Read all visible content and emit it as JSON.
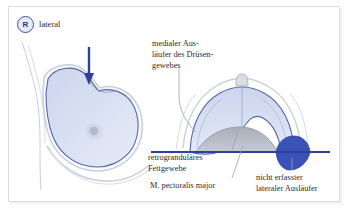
{
  "figure": {
    "type": "anatomical-diagram",
    "language": "de"
  },
  "badge": {
    "letter": "R",
    "circle_stroke": "#3f51a8",
    "circle_fill": "#e8ebf6"
  },
  "labels": {
    "lateral": "lateral",
    "medial_auslaeufer": "medialer Aus-\nläufer des Drüsen-\ngewebes",
    "retroglandulaeres_fettgewebe": "retrogranduläres\nFettgewebe",
    "pectoralis": "M. pectoralis major",
    "nicht_erfasster": "nicht erfasster\nlateraler Ausläufer"
  },
  "colors": {
    "gland_fill": "#dbe3f3",
    "gland_fill_light": "#e9eef8",
    "gland_stroke": "#5566a8",
    "skin_stroke": "#b9bfc9",
    "arrow": "#2f3f9e",
    "compression_line": "#2f3f9e",
    "uncaptured_region": "#3a52b8",
    "muscle_fill": "#b6bac4",
    "leader_line": "#9aa0ab",
    "text": "#2c2c2c",
    "frame": "#dcdcdc",
    "background": "#ffffff"
  },
  "elements": {
    "arrow_direction": "down",
    "compression_line_orientation": "horizontal",
    "nipple_left_panel": "areola-circle",
    "nipple_right_panel": "protruding-apex"
  }
}
